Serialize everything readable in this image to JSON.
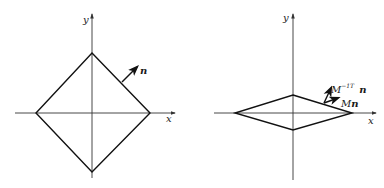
{
  "colors": {
    "line": "#1a1a1a",
    "axis": "#333333",
    "background": "#ffffff"
  },
  "left_panel": {
    "axis_x_label": "x",
    "axis_y_label": "y",
    "normal_label": "n",
    "shape": "diamond (square rotated 45°)"
  },
  "right_panel": {
    "axis_x_label": "x",
    "axis_y_label": "y",
    "transformed_normal_label_base": "M",
    "transformed_normal_label_sup": "−1T",
    "transformed_normal_label_vec": "n",
    "mapped_normal_label_base": "M",
    "mapped_normal_label_vec": "n",
    "shape": "flattened diamond (rhombus)"
  }
}
